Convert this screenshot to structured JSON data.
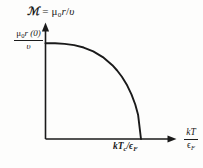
{
  "figure": {
    "background_color": "#fdfdfc",
    "ink_color": "#1a1a1a",
    "title": {
      "symbol": "ℳ",
      "equals": "=",
      "mu": "μ",
      "mu_sub": "0",
      "r": "r",
      "slash": "/",
      "upsilon": "υ",
      "full_text": "ℳ = μ₀r/υ"
    },
    "y_axis_label": {
      "numerator_mu": "μ",
      "numerator_sub": "0",
      "numerator_rest": "r (0)",
      "denominator": "υ",
      "full_text": "μ₀r(0)/υ"
    },
    "x_axis_label": {
      "numerator": "kT",
      "denominator_eps": "ϵ",
      "denominator_sub": "F",
      "full_text": "kT/ϵ_F"
    },
    "x_tick_label": {
      "k": "k",
      "T": "T",
      "T_sub": "c",
      "slash": "/",
      "eps": "ϵ",
      "eps_sub": "F",
      "full_text": "kT_c/ϵ_F"
    }
  },
  "chart_data": {
    "type": "line",
    "xlabel": "kT/ϵ_F",
    "ylabel": "μ₀r(0)/υ",
    "grid": false,
    "legend": null,
    "xlim": [
      0,
      1.45
    ],
    "ylim": [
      0,
      1.1
    ],
    "xticks": [
      1.0
    ],
    "xticklabels": [
      "kT_c/ϵ_F"
    ],
    "yticks": [
      1.0
    ],
    "yticklabels": [
      "μ₀r(0)/υ"
    ],
    "series": [
      {
        "name": "order parameter",
        "description": "BCS-like order parameter decreasing from saturation value at T=0 to zero at T=Tc",
        "x": [
          0.0,
          0.1,
          0.2,
          0.3,
          0.4,
          0.5,
          0.6,
          0.7,
          0.75,
          0.8,
          0.85,
          0.9,
          0.94,
          0.97,
          1.0
        ],
        "y": [
          1.0,
          0.999,
          0.993,
          0.98,
          0.955,
          0.915,
          0.855,
          0.77,
          0.715,
          0.65,
          0.57,
          0.465,
          0.36,
          0.25,
          0.0
        ]
      }
    ]
  }
}
